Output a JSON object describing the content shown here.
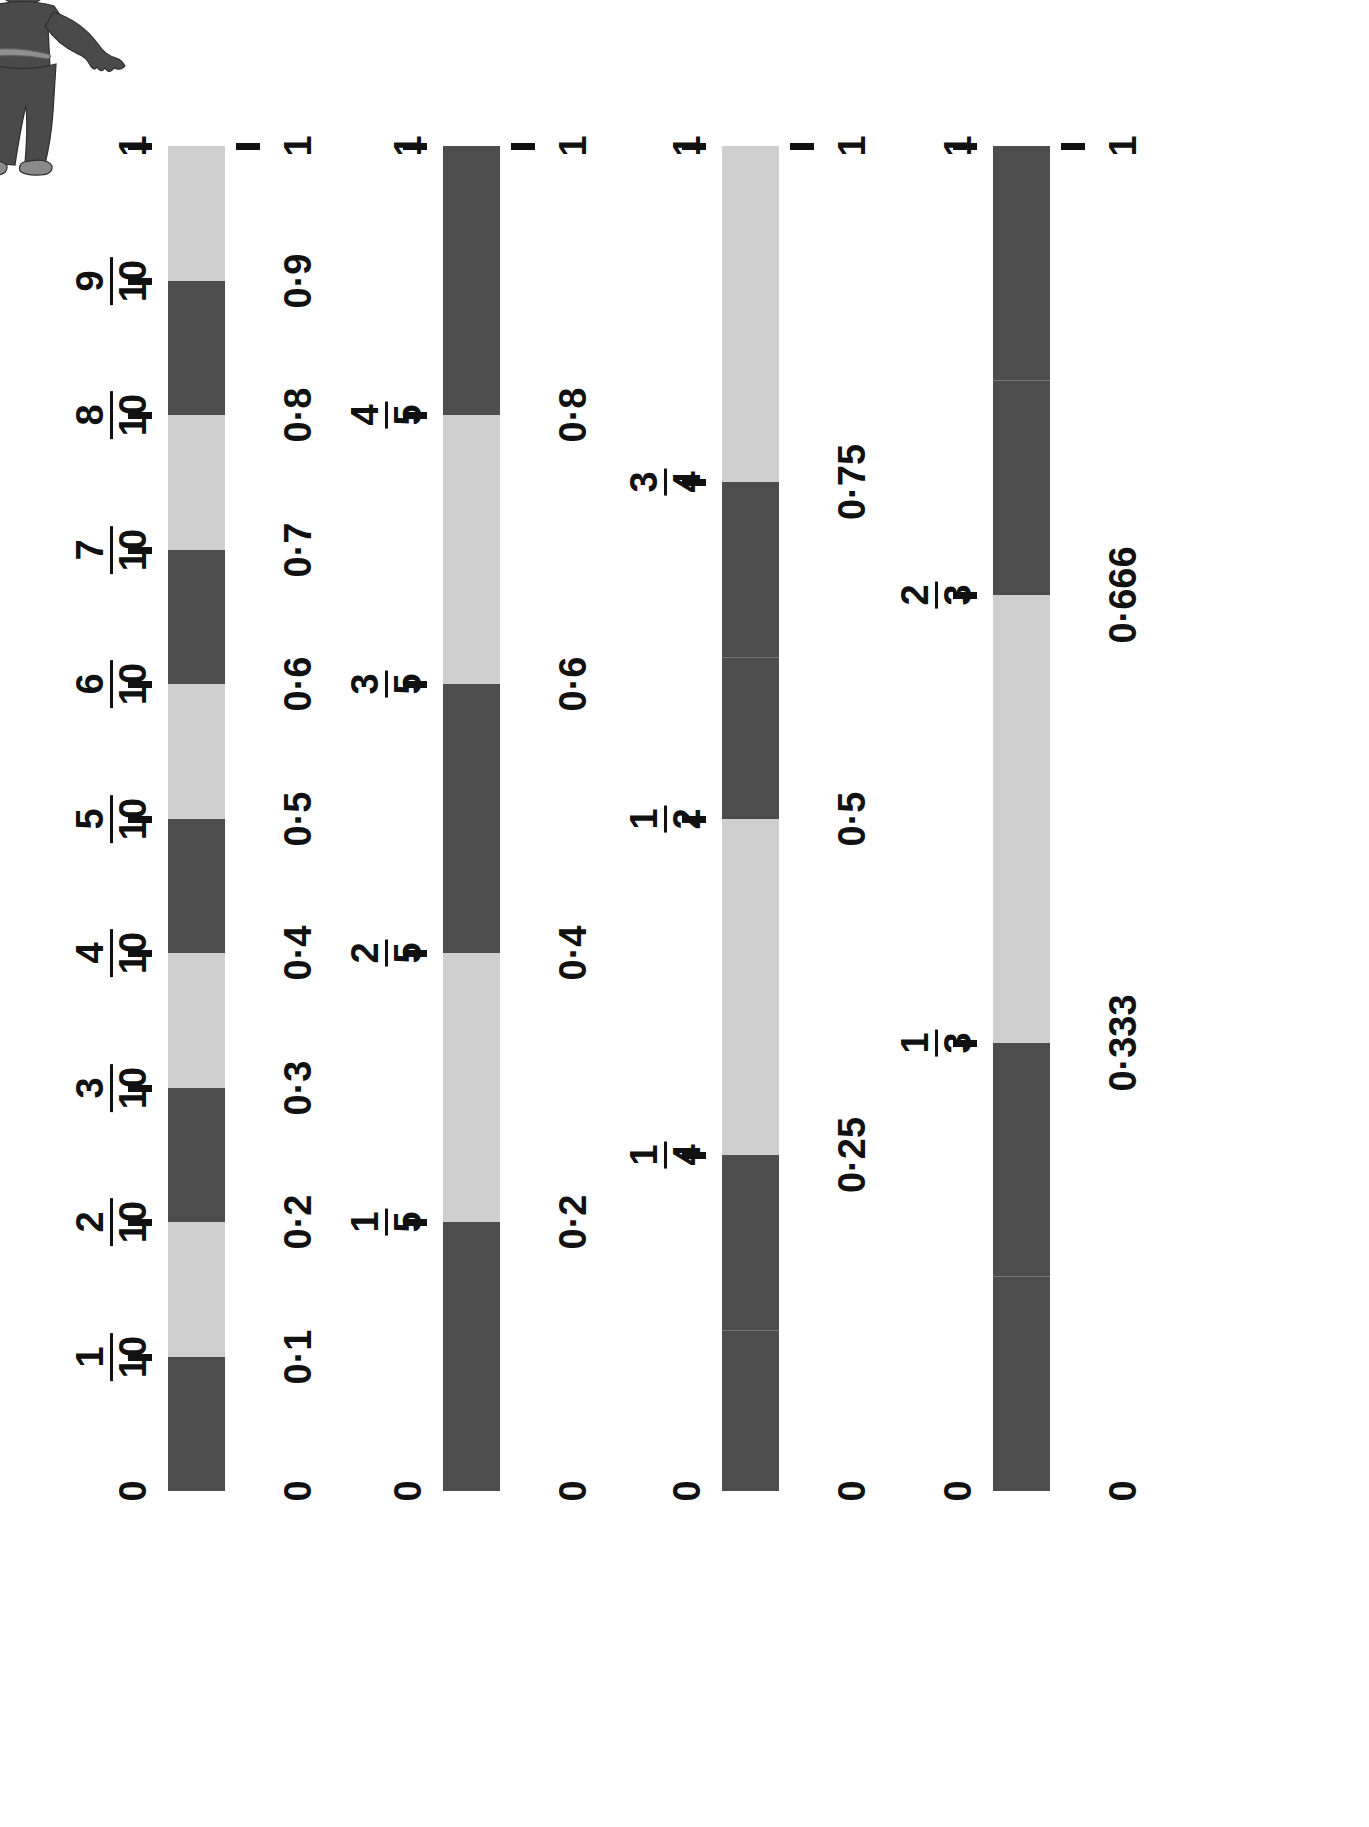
{
  "illustration": {
    "name": "cartoon-figure",
    "description": "boy-with-hoop",
    "alt": "child figure"
  },
  "chart_data": {
    "type": "bar",
    "title": "",
    "subtitle": "",
    "xlabel": "",
    "ylabel": "",
    "grid": false,
    "legend": null,
    "orientation": "vertical-bars-rotated-90",
    "axis_range": [
      0,
      1
    ],
    "end_labels": {
      "bottom": "0",
      "top": "1"
    },
    "bars": [
      {
        "name": "tenths",
        "denominator": 10,
        "fraction_labels": [
          {
            "value": 0.1,
            "num": "1",
            "den": "10"
          },
          {
            "value": 0.2,
            "num": "2",
            "den": "10"
          },
          {
            "value": 0.3,
            "num": "3",
            "den": "10"
          },
          {
            "value": 0.4,
            "num": "4",
            "den": "10"
          },
          {
            "value": 0.5,
            "num": "5",
            "den": "10"
          },
          {
            "value": 0.6,
            "num": "6",
            "den": "10"
          },
          {
            "value": 0.7,
            "num": "7",
            "den": "10"
          },
          {
            "value": 0.8,
            "num": "8",
            "den": "10"
          },
          {
            "value": 0.9,
            "num": "9",
            "den": "10"
          }
        ],
        "decimal_labels": [
          {
            "value": 0.1,
            "text": "0·1"
          },
          {
            "value": 0.2,
            "text": "0·2"
          },
          {
            "value": 0.3,
            "text": "0·3"
          },
          {
            "value": 0.4,
            "text": "0·4"
          },
          {
            "value": 0.5,
            "text": "0·5"
          },
          {
            "value": 0.6,
            "text": "0·6"
          },
          {
            "value": 0.7,
            "text": "0·7"
          },
          {
            "value": 0.8,
            "text": "0·8"
          },
          {
            "value": 0.9,
            "text": "0·9"
          }
        ],
        "segments": [
          {
            "from": 0.0,
            "to": 0.1,
            "shade": "dark"
          },
          {
            "from": 0.1,
            "to": 0.2,
            "shade": "light"
          },
          {
            "from": 0.2,
            "to": 0.3,
            "shade": "dark"
          },
          {
            "from": 0.3,
            "to": 0.4,
            "shade": "light"
          },
          {
            "from": 0.4,
            "to": 0.5,
            "shade": "dark"
          },
          {
            "from": 0.5,
            "to": 0.6,
            "shade": "light"
          },
          {
            "from": 0.6,
            "to": 0.7,
            "shade": "dark"
          },
          {
            "from": 0.7,
            "to": 0.8,
            "shade": "light"
          },
          {
            "from": 0.8,
            "to": 0.9,
            "shade": "dark"
          },
          {
            "from": 0.9,
            "to": 1.0,
            "shade": "light"
          }
        ]
      },
      {
        "name": "fifths",
        "denominator": 5,
        "fraction_labels": [
          {
            "value": 0.2,
            "num": "1",
            "den": "5"
          },
          {
            "value": 0.4,
            "num": "2",
            "den": "5"
          },
          {
            "value": 0.6,
            "num": "3",
            "den": "5"
          },
          {
            "value": 0.8,
            "num": "4",
            "den": "5"
          }
        ],
        "decimal_labels": [
          {
            "value": 0.2,
            "text": "0·2"
          },
          {
            "value": 0.4,
            "text": "0·4"
          },
          {
            "value": 0.6,
            "text": "0·6"
          },
          {
            "value": 0.8,
            "text": "0·8"
          }
        ],
        "segments": [
          {
            "from": 0.0,
            "to": 0.2,
            "shade": "dark"
          },
          {
            "from": 0.2,
            "to": 0.4,
            "shade": "light"
          },
          {
            "from": 0.4,
            "to": 0.6,
            "shade": "dark"
          },
          {
            "from": 0.6,
            "to": 0.8,
            "shade": "light"
          },
          {
            "from": 0.8,
            "to": 1.0,
            "shade": "dark"
          }
        ]
      },
      {
        "name": "quarters",
        "denominator": 4,
        "fraction_labels": [
          {
            "value": 0.25,
            "num": "1",
            "den": "4"
          },
          {
            "value": 0.5,
            "num": "1",
            "den": "2"
          },
          {
            "value": 0.75,
            "num": "3",
            "den": "4"
          }
        ],
        "decimal_labels": [
          {
            "value": 0.25,
            "text": "0·25"
          },
          {
            "value": 0.5,
            "text": "0·5"
          },
          {
            "value": 0.75,
            "text": "0·75"
          }
        ],
        "segments": [
          {
            "from": 0.0,
            "to": 0.25,
            "shade": "dark"
          },
          {
            "from": 0.25,
            "to": 0.5,
            "shade": "light"
          },
          {
            "from": 0.5,
            "to": 0.75,
            "shade": "dark"
          },
          {
            "from": 0.75,
            "to": 1.0,
            "shade": "light"
          }
        ]
      },
      {
        "name": "thirds",
        "denominator": 3,
        "fraction_labels": [
          {
            "value": 0.333,
            "num": "1",
            "den": "3"
          },
          {
            "value": 0.666,
            "num": "2",
            "den": "3"
          }
        ],
        "decimal_labels": [
          {
            "value": 0.333,
            "text": "0·333"
          },
          {
            "value": 0.666,
            "text": "0·666"
          }
        ],
        "segments": [
          {
            "from": 0.0,
            "to": 0.333,
            "shade": "dark"
          },
          {
            "from": 0.333,
            "to": 0.666,
            "shade": "light"
          },
          {
            "from": 0.666,
            "to": 1.0,
            "shade": "dark"
          }
        ]
      }
    ],
    "colors": {
      "dark": "#4d4d4d",
      "light": "#cfcfcf",
      "ink": "#111111",
      "background": "#ffffff"
    }
  }
}
